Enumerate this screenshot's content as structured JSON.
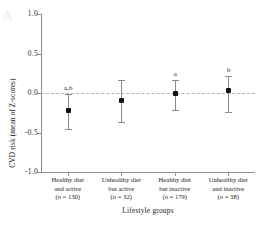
{
  "chart_data": {
    "type": "scatter",
    "title": "",
    "xlabel": "Lifestyle groups",
    "ylabel": "CVD risk (mean of Z-scores)",
    "ylim": [
      -1.0,
      1.0
    ],
    "yticks": [
      "1.0",
      "0.5",
      "0.0",
      "-0.5",
      "-1.0"
    ],
    "ytick_values": [
      1.0,
      0.5,
      0.0,
      -0.5,
      -1.0
    ],
    "grid": false,
    "legend": "none",
    "zero_reference_line": {
      "value": 0.0,
      "style": "dashed",
      "color": "#b4b4b4"
    },
    "error_bar_type": "95% CI",
    "categories": [
      "Healthy diet and active (n = 130)",
      "Unhealthy diet but active (n = 32)",
      "Healthy diet but inactive (n = 179)",
      "Unhealthy diet and inactive (n = 38)"
    ],
    "values": [
      -0.22,
      -0.1,
      -0.01,
      0.03
    ],
    "err_low": [
      -0.45,
      -0.37,
      -0.22,
      -0.24
    ],
    "err_high": [
      -0.01,
      0.17,
      0.17,
      0.21
    ],
    "annotations": [
      "a,b",
      "",
      "a",
      "b"
    ]
  },
  "axis": {
    "y_title": "CVD risk (mean of Z-scores)",
    "x_title": "Lifestyle groups",
    "y_ticks": [
      {
        "label": "1.0",
        "value": 1.0
      },
      {
        "label": "0.5",
        "value": 0.5
      },
      {
        "label": "0.0",
        "value": 0.0
      },
      {
        "label": "-0.5",
        "value": -0.5
      },
      {
        "label": "-1.0",
        "value": -1.0
      }
    ]
  },
  "groups": [
    {
      "line1": "Healthy diet",
      "line2": "and active",
      "n_label": "(n = 130)",
      "n_value": 130,
      "mean": -0.22,
      "ci_low": -0.45,
      "ci_high": -0.01,
      "sig": "a,b"
    },
    {
      "line1": "Unhealthy diet",
      "line2": "but active",
      "n_label": "(n = 32)",
      "n_value": 32,
      "mean": -0.1,
      "ci_low": -0.37,
      "ci_high": 0.17,
      "sig": ""
    },
    {
      "line1": "Healthy diet",
      "line2": "but inactive",
      "n_label": "(n = 179)",
      "n_value": 179,
      "mean": -0.01,
      "ci_low": -0.22,
      "ci_high": 0.17,
      "sig": "a"
    },
    {
      "line1": "Unhealthy diet",
      "line2": "and inactive",
      "n_label": "(n = 38)",
      "n_value": 38,
      "mean": 0.03,
      "ci_low": -0.24,
      "ci_high": 0.21,
      "sig": "b"
    }
  ],
  "watermark": "A",
  "colors": {
    "marker": "#111111",
    "error_bar": "#8a8a8a",
    "axis": "#8e8e8e",
    "zero_line": "#b4b4b4",
    "text": "#1c1c1c",
    "background": "#ffffff"
  }
}
